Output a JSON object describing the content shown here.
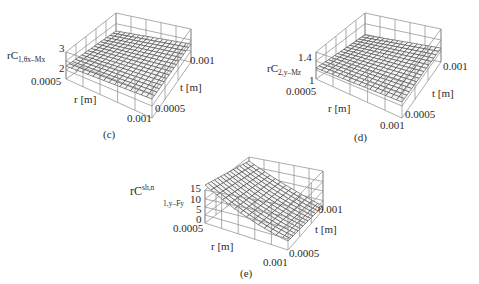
{
  "figure": {
    "panels": [
      {
        "id": "c",
        "caption": "(c)",
        "z_label_main": "rC",
        "z_label_sub": "1,θx–Mx",
        "z_ticks": [
          "3",
          "2"
        ],
        "r_label": "r [m]",
        "t_label": "t [m]",
        "r_ticks": [
          "0.0005",
          "0.001"
        ],
        "t_ticks": [
          "0.0005",
          "0.001"
        ]
      },
      {
        "id": "d",
        "caption": "(d)",
        "z_label_main": "rC",
        "z_label_sub": "2,y–Mz",
        "z_ticks": [
          "1.4",
          "1"
        ],
        "r_label": "r [m]",
        "t_label": "t [m]",
        "r_ticks": [
          "0.0005",
          "0.001"
        ],
        "t_ticks": [
          "0.0005",
          "0.001"
        ]
      },
      {
        "id": "e",
        "caption": "(e)",
        "z_label_main": "rC",
        "z_label_sup": "sh,n",
        "z_label_sub": "1,y–Fy",
        "z_ticks": [
          "15",
          "10",
          "5",
          "0"
        ],
        "r_label": "r [m]",
        "t_label": "t [m]",
        "r_ticks": [
          "0.0005",
          "0.001"
        ],
        "t_ticks": [
          "0.0005",
          "0.001"
        ]
      }
    ]
  },
  "chart_data": [
    {
      "type": "surface3d",
      "title": "(c)",
      "xlabel": "r [m]",
      "ylabel": "t [m]",
      "zlabel": "rC_{1,θx–Mx}",
      "x_range": [
        0.0005,
        0.001
      ],
      "y_range": [
        0.0005,
        0.001
      ],
      "zlim": [
        1.5,
        3.5
      ],
      "z_ticks": [
        2,
        3
      ],
      "description": "Nearly flat surface around z≈2.1–2.4, slightly rising toward large t",
      "grid": true
    },
    {
      "type": "surface3d",
      "title": "(d)",
      "xlabel": "r [m]",
      "ylabel": "t [m]",
      "zlabel": "rC_{2,y–Mz}",
      "x_range": [
        0.0005,
        0.001
      ],
      "y_range": [
        0.0005,
        0.001
      ],
      "zlim": [
        0.9,
        1.6
      ],
      "z_ticks": [
        1,
        1.4
      ],
      "description": "Nearly flat surface around z≈1.15–1.25",
      "grid": true
    },
    {
      "type": "surface3d",
      "title": "(e)",
      "xlabel": "r [m]",
      "ylabel": "t [m]",
      "zlabel": "rC^{sh,n}_{1,y–Fy}",
      "x_range": [
        0.0005,
        0.001
      ],
      "y_range": [
        0.0005,
        0.001
      ],
      "zlim": [
        0,
        17
      ],
      "z_ticks": [
        0,
        5,
        10,
        15
      ],
      "description": "Curved surface: high (~15) at small r / small t back corner, decreasing to ~1 at large r, large t",
      "grid": true
    }
  ]
}
